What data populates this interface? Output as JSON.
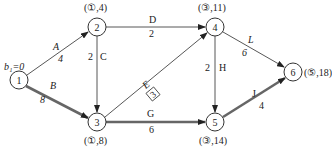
{
  "diagram": {
    "type": "network-shortest-path",
    "start_label": "b₁=0",
    "nodes": [
      {
        "id": "1",
        "x": 19,
        "y": 80,
        "label": ""
      },
      {
        "id": "2",
        "x": 97,
        "y": 27,
        "label": "(①,4)"
      },
      {
        "id": "3",
        "x": 97,
        "y": 122,
        "label": "(①,8)"
      },
      {
        "id": "4",
        "x": 215,
        "y": 27,
        "label": "(③,11)"
      },
      {
        "id": "5",
        "x": 215,
        "y": 122,
        "label": "(③,14)"
      },
      {
        "id": "6",
        "x": 293,
        "y": 72,
        "label": "(⑤,18)"
      }
    ],
    "edges": [
      {
        "name": "A",
        "weight": "4",
        "from": "1",
        "to": "2",
        "critical": false
      },
      {
        "name": "B",
        "weight": "8",
        "from": "1",
        "to": "3",
        "critical": true
      },
      {
        "name": "C",
        "weight": "2",
        "from": "2",
        "to": "3",
        "critical": false
      },
      {
        "name": "D",
        "weight": "2",
        "from": "2",
        "to": "4",
        "critical": false
      },
      {
        "name": "E",
        "weight": "3",
        "from": "3",
        "to": "4",
        "critical": false,
        "boxed": true
      },
      {
        "name": "G",
        "weight": "6",
        "from": "3",
        "to": "5",
        "critical": true
      },
      {
        "name": "H",
        "weight": "2",
        "from": "4",
        "to": "5",
        "critical": false
      },
      {
        "name": "L",
        "weight": "6",
        "from": "4",
        "to": "6",
        "critical": false
      },
      {
        "name": "J",
        "weight": "4",
        "from": "5",
        "to": "6",
        "critical": true
      }
    ]
  }
}
